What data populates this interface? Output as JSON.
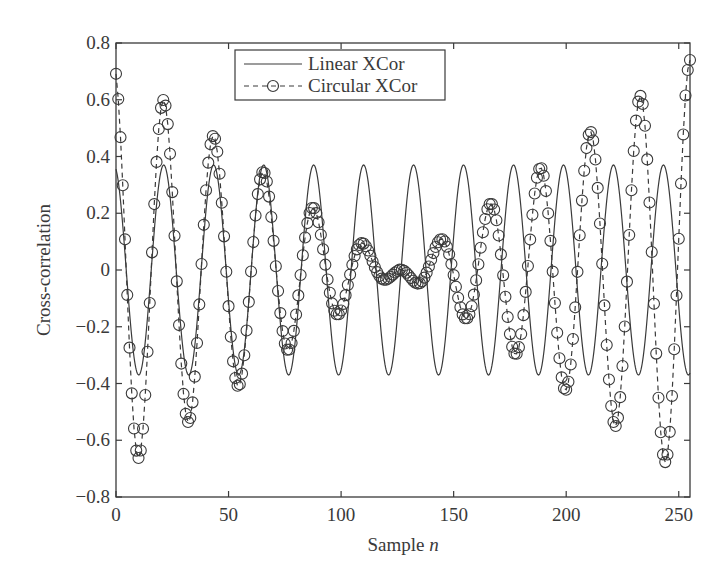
{
  "chart_data": {
    "type": "line",
    "title": "",
    "xlabel": "Sample",
    "xlabel_italic": "n",
    "ylabel": "Cross-correlation",
    "xlim": [
      0,
      255
    ],
    "ylim": [
      -0.8,
      0.8
    ],
    "xticks": [
      0,
      50,
      100,
      150,
      200,
      250
    ],
    "xtick_labels": [
      "0",
      "50",
      "100",
      "150",
      "200",
      "250"
    ],
    "yticks": [
      -0.8,
      -0.6,
      -0.4,
      -0.2,
      0,
      0.2,
      0.4,
      0.6,
      0.8
    ],
    "ytick_labels": [
      "−0.8",
      "−0.6",
      "−0.4",
      "−0.2",
      "0",
      "0.2",
      "0.4",
      "0.6",
      "0.8"
    ],
    "grid": false,
    "legend_position": "upper center-left",
    "x": "integers 0..255",
    "series": [
      {
        "name": "Linear XCor",
        "style": "solid line",
        "color": "#3a3a3a",
        "model": {
          "amplitude": 0.37,
          "period": 22.2,
          "phase_center": 21.2
        },
        "peaks": [
          [
            21,
            0.37
          ],
          [
            43,
            0.37
          ],
          [
            65,
            0.37
          ],
          [
            88,
            0.37
          ],
          [
            110,
            0.37
          ],
          [
            132,
            0.37
          ],
          [
            154,
            0.37
          ],
          [
            177,
            0.37
          ],
          [
            199,
            0.37
          ],
          [
            221,
            0.37
          ],
          [
            243,
            0.37
          ]
        ],
        "troughs": [
          [
            10,
            -0.37
          ],
          [
            32,
            -0.37
          ],
          [
            54,
            -0.37
          ],
          [
            77,
            -0.37
          ],
          [
            99,
            -0.37
          ],
          [
            121,
            -0.37
          ],
          [
            143,
            -0.37
          ],
          [
            166,
            -0.37
          ],
          [
            188,
            -0.37
          ],
          [
            210,
            -0.37
          ],
          [
            232,
            -0.37
          ],
          [
            255,
            -0.37
          ]
        ]
      },
      {
        "name": "Circular XCor",
        "style": "dashed line with circle markers",
        "color": "#3a3a3a",
        "model": {
          "left": {
            "amp0": 0.72,
            "decay_per_sample": 0.0057,
            "period": 22.2,
            "phase_center": 21.2
          },
          "right": {
            "amp_end": 0.74,
            "decay_per_sample": 0.0057,
            "period": 22.2,
            "phase_center": 255
          }
        },
        "peaks": [
          [
            0,
            0.72
          ],
          [
            21,
            0.63
          ],
          [
            43,
            0.5
          ],
          [
            66,
            0.37
          ],
          [
            88,
            0.24
          ],
          [
            109,
            0.11
          ],
          [
            128,
            0.02
          ],
          [
            146,
            0.1
          ],
          [
            167,
            0.22
          ],
          [
            189,
            0.35
          ],
          [
            210,
            0.48
          ],
          [
            232,
            0.61
          ],
          [
            255,
            0.74
          ]
        ],
        "troughs": [
          [
            11,
            -0.7
          ],
          [
            33,
            -0.57
          ],
          [
            56,
            -0.43
          ],
          [
            78,
            -0.3
          ],
          [
            100,
            -0.17
          ],
          [
            119,
            -0.05
          ],
          [
            137,
            -0.04
          ],
          [
            156,
            -0.15
          ],
          [
            178,
            -0.28
          ],
          [
            200,
            -0.41
          ],
          [
            221,
            -0.54
          ],
          [
            244,
            -0.67
          ]
        ]
      }
    ]
  },
  "legend": {
    "items": [
      {
        "label": "Linear XCor"
      },
      {
        "label": "Circular XCor"
      }
    ]
  },
  "axes": {
    "xlabel": "Sample",
    "xlabel_var": "n",
    "ylabel": "Cross-correlation"
  }
}
